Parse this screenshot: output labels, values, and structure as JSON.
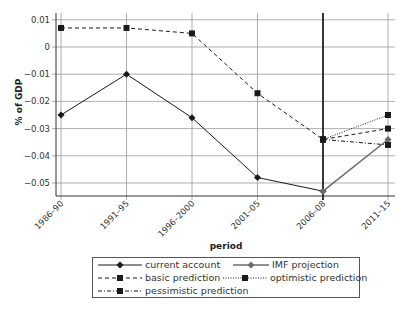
{
  "chart_data": {
    "type": "line",
    "title": "",
    "xlabel": "period",
    "ylabel": "% of GDP",
    "ylim": [
      -0.055,
      0.01
    ],
    "yticks": [
      0.01,
      0,
      -0.01,
      -0.02,
      -0.03,
      -0.04,
      -0.05
    ],
    "ytick_labels": [
      "0.01",
      "0",
      "−0.01",
      "−0.02",
      "−0.03",
      "−0.04",
      "−0.05"
    ],
    "categories": [
      "1986–90",
      "1991–95",
      "1996–2000",
      "2001–05",
      "2006–08",
      "2011–15"
    ],
    "grid": true,
    "legend_position": "bottom",
    "vertical_marker_at": "2006–08",
    "series": [
      {
        "name": "current account",
        "style": "solid",
        "marker": "diamond",
        "color": "#1a1a1a",
        "values": [
          -0.025,
          -0.01,
          -0.026,
          -0.048,
          -0.053,
          null
        ]
      },
      {
        "name": "IMF projection",
        "style": "solid",
        "marker": "diamond",
        "color": "#6b6b6b",
        "values": [
          null,
          null,
          null,
          null,
          -0.053,
          -0.034
        ]
      },
      {
        "name": "basic prediction",
        "style": "dashed",
        "marker": "square",
        "color": "#1a1a1a",
        "values": [
          0.007,
          0.007,
          0.005,
          -0.017,
          -0.034,
          -0.03
        ]
      },
      {
        "name": "optimistic prediction",
        "style": "dotted",
        "marker": "square",
        "color": "#1a1a1a",
        "values": [
          null,
          null,
          null,
          null,
          -0.034,
          -0.025
        ]
      },
      {
        "name": "pessimistic prediction",
        "style": "dashdot",
        "marker": "square",
        "color": "#1a1a1a",
        "values": [
          null,
          null,
          null,
          null,
          -0.034,
          -0.036
        ]
      }
    ]
  },
  "legend": {
    "items": [
      {
        "label": "current account"
      },
      {
        "label": "IMF projection"
      },
      {
        "label": "basic prediction"
      },
      {
        "label": "optimistic prediction"
      },
      {
        "label": "pessimistic prediction"
      }
    ]
  }
}
